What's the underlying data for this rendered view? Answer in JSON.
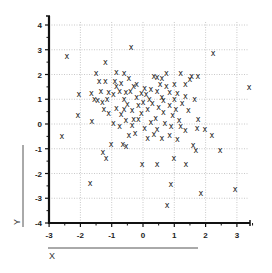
{
  "chart_data": {
    "type": "scatter",
    "title": "",
    "xlabel": "X",
    "ylabel": "Y",
    "xlim": [
      -3,
      3.5
    ],
    "ylim": [
      -4,
      4.3
    ],
    "xticks": [
      -3,
      -2,
      -1,
      0,
      1,
      2,
      3
    ],
    "yticks": [
      -4,
      -3,
      -2,
      -1,
      0,
      1,
      2,
      3,
      4
    ],
    "xtick_labels": [
      "-3",
      "-2",
      "-1",
      "0",
      "1",
      "2",
      "3"
    ],
    "ytick_labels": [
      "-4",
      "-3",
      "-2",
      "-1",
      "0",
      "1",
      "2",
      "3",
      "4"
    ],
    "grid": true,
    "grid_style": "dotted",
    "marker": "x",
    "legend": null,
    "series": [
      {
        "name": "points",
        "points": [
          [
            -2.43,
            2.75
          ],
          [
            -0.38,
            3.11
          ],
          [
            2.24,
            2.87
          ],
          [
            3.39,
            1.49
          ],
          [
            -2.59,
            -0.48
          ],
          [
            -2.08,
            0.36
          ],
          [
            -1.63,
            0.12
          ],
          [
            -1.69,
            -2.38
          ],
          [
            -1.28,
            -1.13
          ],
          [
            -1.18,
            -1.37
          ],
          [
            -1.02,
            -0.81
          ],
          [
            -0.64,
            -0.81
          ],
          [
            -0.54,
            -0.89
          ],
          [
            -0.03,
            -1.62
          ],
          [
            0.45,
            -1.62
          ],
          [
            0.77,
            -3.27
          ],
          [
            0.89,
            -2.42
          ],
          [
            0.99,
            -1.37
          ],
          [
            1.37,
            -1.62
          ],
          [
            1.69,
            -1.05
          ],
          [
            1.85,
            -2.79
          ],
          [
            2.94,
            -2.63
          ],
          [
            2.46,
            -1.05
          ],
          [
            1.6,
            -0.85
          ],
          [
            1.73,
            -0.16
          ],
          [
            1.76,
            0.2
          ],
          [
            1.98,
            -0.2
          ],
          [
            2.2,
            -0.44
          ],
          [
            -1.2,
            2.5
          ],
          [
            -1.5,
            2.05
          ],
          [
            -0.85,
            2.1
          ],
          [
            -0.6,
            2.05
          ],
          [
            -1.4,
            1.75
          ],
          [
            -1.2,
            1.75
          ],
          [
            -0.9,
            1.75
          ],
          [
            -0.7,
            1.65
          ],
          [
            -0.45,
            1.85
          ],
          [
            -0.3,
            1.55
          ],
          [
            0.35,
            1.95
          ],
          [
            0.45,
            1.9
          ],
          [
            0.6,
            1.85
          ],
          [
            0.75,
            2.05
          ],
          [
            1.2,
            2.05
          ],
          [
            1.35,
            1.6
          ],
          [
            1.55,
            1.95
          ],
          [
            1.75,
            1.95
          ],
          [
            1.5,
            1.8
          ],
          [
            0.55,
            1.6
          ],
          [
            -2.05,
            1.2
          ],
          [
            -1.65,
            1.25
          ],
          [
            -1.35,
            1.35
          ],
          [
            -1.1,
            1.3
          ],
          [
            -1.55,
            1.0
          ],
          [
            -1.45,
            0.95
          ],
          [
            -1.3,
            0.9
          ],
          [
            -1.15,
            1.0
          ],
          [
            -0.95,
            1.2
          ],
          [
            -0.75,
            1.35
          ],
          [
            -0.55,
            1.3
          ],
          [
            -0.4,
            1.35
          ],
          [
            -0.2,
            1.1
          ],
          [
            -0.05,
            1.25
          ],
          [
            0.1,
            1.2
          ],
          [
            0.25,
            1.4
          ],
          [
            0.45,
            1.35
          ],
          [
            0.6,
            1.1
          ],
          [
            0.85,
            1.3
          ],
          [
            1.1,
            1.25
          ],
          [
            1.35,
            1.15
          ],
          [
            1.65,
            1.0
          ],
          [
            -1.25,
            0.6
          ],
          [
            -1.1,
            0.45
          ],
          [
            -0.85,
            0.65
          ],
          [
            -0.7,
            0.4
          ],
          [
            -0.5,
            0.8
          ],
          [
            -0.35,
            0.55
          ],
          [
            -0.15,
            0.75
          ],
          [
            0.0,
            0.9
          ],
          [
            0.15,
            0.6
          ],
          [
            0.3,
            0.85
          ],
          [
            0.5,
            0.7
          ],
          [
            0.65,
            0.5
          ],
          [
            0.85,
            0.75
          ],
          [
            1.05,
            0.6
          ],
          [
            1.25,
            0.85
          ],
          [
            1.45,
            0.55
          ],
          [
            -0.95,
            0.05
          ],
          [
            -0.75,
            -0.1
          ],
          [
            -0.55,
            0.15
          ],
          [
            -0.35,
            -0.05
          ],
          [
            -0.15,
            0.2
          ],
          [
            0.05,
            -0.15
          ],
          [
            0.25,
            0.1
          ],
          [
            0.45,
            -0.2
          ],
          [
            0.7,
            0.05
          ],
          [
            0.9,
            -0.1
          ],
          [
            1.15,
            0.15
          ],
          [
            1.35,
            -0.25
          ],
          [
            -0.45,
            -0.45
          ],
          [
            -0.25,
            -0.35
          ],
          [
            0.15,
            -0.55
          ],
          [
            0.35,
            -0.4
          ],
          [
            0.6,
            -0.55
          ],
          [
            0.85,
            -0.45
          ],
          [
            1.1,
            -0.6
          ],
          [
            -0.85,
            1.55
          ],
          [
            -0.6,
            1.0
          ],
          [
            -0.2,
            1.6
          ],
          [
            0.05,
            1.45
          ],
          [
            0.2,
            1.0
          ],
          [
            0.4,
            0.25
          ],
          [
            0.95,
            0.35
          ],
          [
            1.2,
            -0.1
          ],
          [
            -0.05,
            0.45
          ],
          [
            -0.3,
            0.2
          ],
          [
            -0.6,
            0.6
          ],
          [
            0.65,
            0.95
          ],
          [
            1.0,
            1.0
          ],
          [
            0.75,
            1.55
          ],
          [
            1.0,
            1.6
          ]
        ]
      }
    ]
  },
  "axes": {
    "x_label": "X",
    "y_label": "Y"
  }
}
